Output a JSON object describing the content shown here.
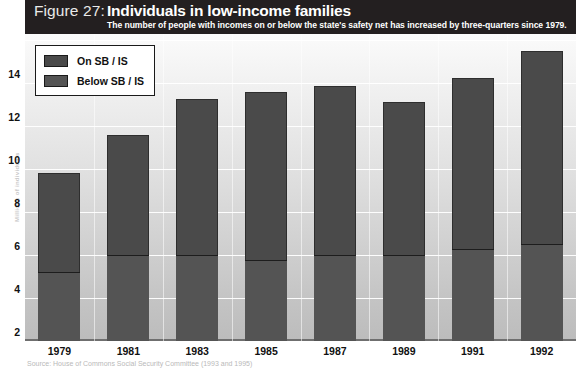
{
  "figure": {
    "number_label": "Figure 27:",
    "title": "Individuals in low-income families",
    "subtitle": "The number of people with incomes on or below the state's safety net has increased by three-quarters since 1979.",
    "source": "Source: House of Commons Social Security Committee (1993 and 1995)",
    "y_axis_caption": "Millions of individuals"
  },
  "colors": {
    "band_background": "#231f20",
    "series_on": "#4a4a4a",
    "series_below": "#545454",
    "gridline": "#ffffff",
    "plot_top": "#fbfbfb",
    "plot_bottom": "#bcbcbc"
  },
  "legend": {
    "items": [
      {
        "label": "On SB / IS",
        "color": "#4a4a4a"
      },
      {
        "label": "Below SB / IS",
        "color": "#545454"
      }
    ]
  },
  "chart_data": {
    "type": "bar",
    "stacked": true,
    "title": "Individuals in low-income families",
    "subtitle": "The number of people with incomes on or below the state's safety net has increased by three-quarters since 1979.",
    "xlabel": "",
    "ylabel": "Millions of individuals",
    "categories": [
      "1979",
      "1981",
      "1983",
      "1985",
      "1987",
      "1989",
      "1991",
      "1992"
    ],
    "ylim": [
      0,
      14
    ],
    "yticks": [
      2,
      4,
      6,
      8,
      10,
      12,
      14
    ],
    "ytick_labels": [
      "2",
      "4",
      "6",
      "8",
      "10",
      "12",
      "14"
    ],
    "grid": true,
    "legend_position": "top-left",
    "series": [
      {
        "name": "Below SB / IS",
        "values": [
          3.2,
          4.0,
          4.0,
          3.75,
          4.0,
          4.0,
          4.3,
          4.5
        ]
      },
      {
        "name": "On SB / IS",
        "values": [
          4.6,
          5.6,
          7.25,
          7.85,
          7.85,
          7.1,
          7.95,
          9.0
        ]
      }
    ],
    "totals": [
      7.8,
      9.6,
      11.25,
      11.6,
      11.85,
      11.1,
      12.25,
      13.5
    ]
  }
}
